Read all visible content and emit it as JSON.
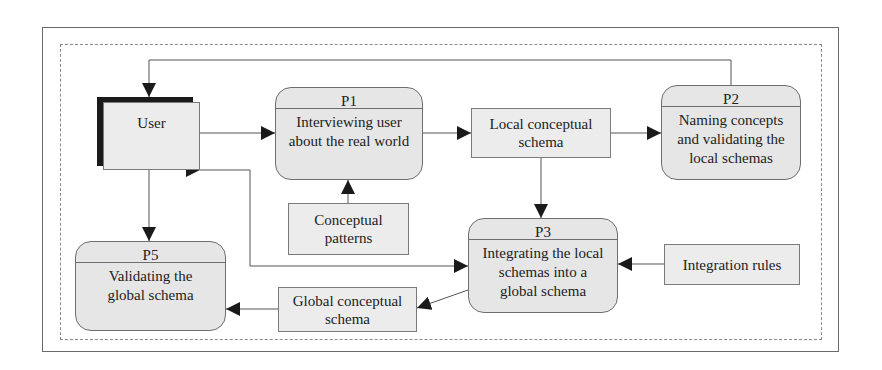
{
  "diagram": {
    "external_entity": {
      "id": "user",
      "label": "User"
    },
    "processes": [
      {
        "id": "P1",
        "label": "P1",
        "text": "Interviewing user about the real world"
      },
      {
        "id": "P2",
        "label": "P2",
        "text": "Naming concepts and validating the local schemas"
      },
      {
        "id": "P3",
        "label": "P3",
        "text": "Integrating the local schemas into a global schema"
      },
      {
        "id": "P5",
        "label": "P5",
        "text": "Validating the global schema"
      }
    ],
    "data_stores": [
      {
        "id": "local",
        "text": "Local conceptual schema"
      },
      {
        "id": "patterns",
        "text": "Conceptual patterns"
      },
      {
        "id": "rules",
        "text": "Integration rules"
      },
      {
        "id": "global",
        "text": "Global conceptual schema"
      }
    ],
    "flows": [
      {
        "from": "P2",
        "to": "user",
        "type": "one-way",
        "route": "top loop"
      },
      {
        "from": "user",
        "to": "P1",
        "type": "two-way"
      },
      {
        "from": "P1",
        "to": "local",
        "type": "two-way"
      },
      {
        "from": "local",
        "to": "P2",
        "type": "two-way"
      },
      {
        "from": "patterns",
        "to": "P1",
        "type": "one-way"
      },
      {
        "from": "local",
        "to": "P3",
        "type": "one-way"
      },
      {
        "from": "user",
        "to": "P3",
        "type": "two-way",
        "route": "lower loop"
      },
      {
        "from": "rules",
        "to": "P3",
        "type": "one-way"
      },
      {
        "from": "P3",
        "to": "global",
        "type": "one-way"
      },
      {
        "from": "global",
        "to": "P5",
        "type": "two-way"
      },
      {
        "from": "user",
        "to": "P5",
        "type": "two-way"
      }
    ]
  }
}
